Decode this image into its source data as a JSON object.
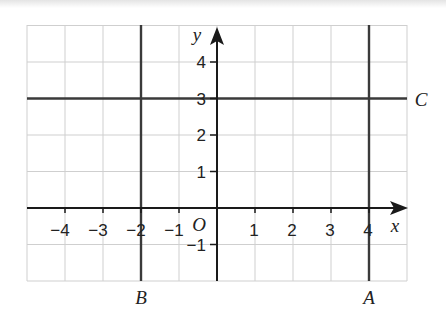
{
  "diagram": {
    "type": "coordinate-grid",
    "x_axis_label": "x",
    "y_axis_label": "y",
    "origin_label": "O",
    "x_range": [
      -5,
      5
    ],
    "y_range": [
      -2,
      5
    ],
    "x_tick_labels": [
      "−4",
      "−3",
      "−2",
      "−1",
      "1",
      "2",
      "3",
      "4"
    ],
    "y_tick_labels": [
      "4",
      "3",
      "2",
      "1",
      "−1"
    ],
    "lines": [
      {
        "name": "A",
        "equation": "x = 4",
        "orientation": "vertical",
        "value": 4
      },
      {
        "name": "B",
        "equation": "x = -2",
        "orientation": "vertical",
        "value": -2
      },
      {
        "name": "C",
        "equation": "y = 3",
        "orientation": "horizontal",
        "value": 3
      }
    ]
  },
  "labels": {
    "x": "x",
    "y": "y",
    "origin": "O",
    "A": "A",
    "B": "B",
    "C": "C",
    "xticks": {
      "n4": "−4",
      "n3": "−3",
      "n2": "−2",
      "n1": "−1",
      "p1": "1",
      "p2": "2",
      "p3": "3",
      "p4": "4"
    },
    "yticks": {
      "p4": "4",
      "p3": "3",
      "p2": "2",
      "p1": "1",
      "n1": "−1"
    }
  },
  "colors": {
    "grid": "#cfcfcf",
    "axis": "#1a1a1a",
    "lines": "#3a3a3a",
    "background": "#ffffff"
  }
}
